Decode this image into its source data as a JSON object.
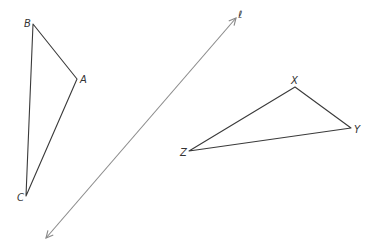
{
  "diagram": {
    "type": "geometry-reflection",
    "line": {
      "label": "ℓ",
      "color": "#8a8a8a",
      "start": [
        46,
        238
      ],
      "end": [
        236,
        18
      ],
      "arrows": "both"
    },
    "triangles": [
      {
        "name": "ABC",
        "vertices": [
          {
            "label": "B",
            "x": 33,
            "y": 24
          },
          {
            "label": "A",
            "x": 77,
            "y": 79
          },
          {
            "label": "C",
            "x": 26,
            "y": 196
          }
        ]
      },
      {
        "name": "XYZ",
        "vertices": [
          {
            "label": "X",
            "x": 295,
            "y": 87
          },
          {
            "label": "Y",
            "x": 351,
            "y": 128
          },
          {
            "label": "Z",
            "x": 189,
            "y": 151
          }
        ]
      }
    ],
    "labels": {
      "B": "B",
      "A": "A",
      "C": "C",
      "X": "X",
      "Y": "Y",
      "Z": "Z",
      "l": "ℓ"
    }
  }
}
